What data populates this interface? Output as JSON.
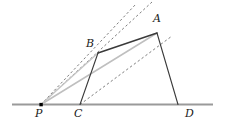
{
  "figure": {
    "type": "geometry-diagram",
    "width": 226,
    "height": 127,
    "colors": {
      "baseline": "#9a9a9a",
      "solid_dark": "#3a3a3a",
      "solid_light": "#b8b8b8",
      "dashed": "#6f6f6f",
      "label": "#1a1a1a",
      "point_fill": "#000000",
      "background": "#ffffff"
    },
    "baseline": {
      "name": "baseline",
      "x1": 12,
      "y1": 104.5,
      "x2": 213,
      "y2": 104.5,
      "width": 2.2
    },
    "points": [
      {
        "id": "P",
        "label": "P",
        "x": 41,
        "y": 104.5,
        "label_x": 35,
        "label_y": 108,
        "marked": true
      },
      {
        "id": "C",
        "label": "C",
        "x": 80,
        "y": 104.5,
        "label_x": 74,
        "label_y": 108,
        "marked": false
      },
      {
        "id": "D",
        "label": "D",
        "x": 178,
        "y": 104.5,
        "label_x": 186,
        "label_y": 108,
        "marked": false
      },
      {
        "id": "B",
        "label": "B",
        "x": 98,
        "y": 53,
        "label_x": 86,
        "label_y": 40,
        "marked": false
      },
      {
        "id": "A",
        "label": "A",
        "x": 157,
        "y": 33,
        "label_x": 153,
        "label_y": 15,
        "marked": false
      }
    ],
    "segments": [
      {
        "id": "BA",
        "from": "B",
        "to": "A",
        "style": "solid",
        "weight": "dark",
        "width": 1.4
      },
      {
        "id": "AD",
        "from": "A",
        "to": "D",
        "style": "solid",
        "weight": "dark",
        "width": 1.1
      },
      {
        "id": "CB",
        "from": "C",
        "to": "B",
        "style": "solid",
        "weight": "dark",
        "width": 1.1
      },
      {
        "id": "PA",
        "from": "P",
        "to": "A",
        "style": "solid",
        "weight": "light",
        "width": 1.4
      },
      {
        "id": "PB",
        "from": "P",
        "to": "B",
        "style": "solid",
        "weight": "light",
        "width": 1.4
      }
    ],
    "dashed_rays": [
      {
        "id": "ray-P-through-B",
        "from": "P",
        "through": "B",
        "x1": 41,
        "y1": 104.5,
        "x2": 136,
        "y2": 4
      },
      {
        "id": "ray-P-through-A",
        "from": "P",
        "through": "A",
        "x1": 41,
        "y1": 104.5,
        "x2": 152,
        "y2": 2
      },
      {
        "id": "ray-C-through-A",
        "from": "C",
        "through": "A",
        "x1": 80,
        "y1": 104.5,
        "x2": 172,
        "y2": 36
      }
    ],
    "point_marker": {
      "name": "point-P-marker",
      "x": 41,
      "y": 104.5,
      "size": 3.2
    }
  }
}
